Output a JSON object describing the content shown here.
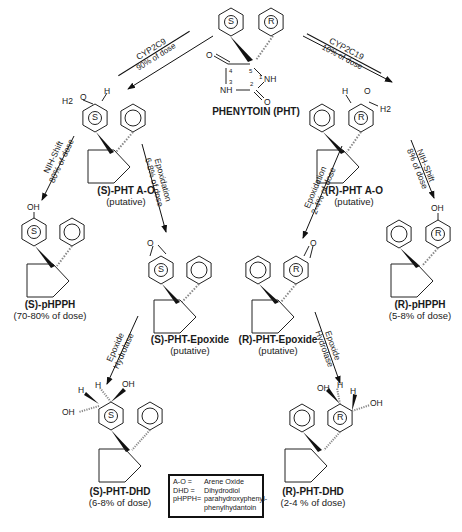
{
  "parent": {
    "name": "PHENYTOIN (PHT)",
    "ring_labels": [
      "S",
      "R"
    ],
    "atom_numbers": [
      "1",
      "2",
      "3",
      "4",
      "5"
    ],
    "atoms": {
      "nh1": "NH",
      "nh3": "NH",
      "o": "O"
    }
  },
  "enzymes": {
    "left": {
      "name": "CYP2C9",
      "fraction": "90% of dose"
    },
    "right": {
      "name": "CYP2C19",
      "fraction": "10% of dose"
    }
  },
  "steps": {
    "s_nih": {
      "name": "NIH-Shift",
      "fraction": "80% of dose"
    },
    "s_epox": {
      "name": "Epoxidation",
      "fraction": "6-8% of dose"
    },
    "r_epox": {
      "name": "Epoxidation",
      "fraction": "2-4% of dose"
    },
    "r_nih": {
      "name": "NIH-Shift",
      "fraction": "8% of dose"
    },
    "s_hydrolase": {
      "line1": "Epoxide",
      "line2": "Hydrolase"
    },
    "r_hydrolase": {
      "line1": "Epoxide",
      "line2": "Hydrolase"
    }
  },
  "compounds": {
    "s_ao": {
      "name": "(S)-PHT A-O",
      "note": "(putative)"
    },
    "r_ao": {
      "name": "(R)-PHT A-O",
      "note": "(putative)"
    },
    "s_phpph": {
      "name": "(S)-pHPPH",
      "note": "(70-80% of dose)"
    },
    "r_phpph": {
      "name": "(R)-pHPPH",
      "note": "(5-8% of dose)"
    },
    "s_epoxide": {
      "name": "(S)-PHT-Epoxide",
      "note": "(putative)"
    },
    "r_epoxide": {
      "name": "(R)-PHT-Epoxide",
      "note": "(putative)"
    },
    "s_dhd": {
      "name": "(S)-PHT-DHD",
      "note": "(6-8% of dose)"
    },
    "r_dhd": {
      "name": "(R)-PHT-DHD",
      "note": "(2-4 % of dose)"
    }
  },
  "atom_labels": {
    "oh": "OH",
    "h": "H",
    "h2": "H2",
    "o": "O",
    "s": "S",
    "r": "R"
  },
  "legend": [
    {
      "abbr": "A-O =",
      "meaning": "Arene Oxide"
    },
    {
      "abbr": "DHD =",
      "meaning": "Dihydrodiol"
    },
    {
      "abbr": "pHPPH=",
      "meaning": "parahydroxyphenyl-"
    },
    {
      "abbr": "",
      "meaning": "phenylhydantoin"
    }
  ]
}
